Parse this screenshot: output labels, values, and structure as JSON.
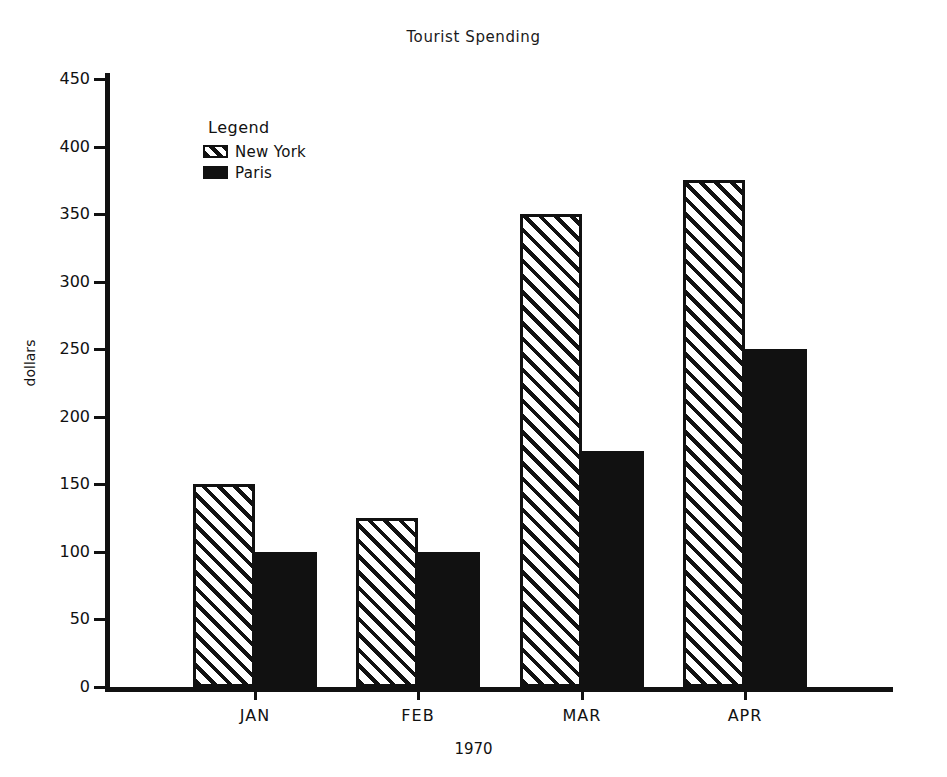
{
  "chart_data": {
    "type": "bar",
    "title": "Tourist Spending",
    "xlabel": "1970",
    "ylabel": "dollars",
    "categories": [
      "JAN",
      "FEB",
      "MAR",
      "APR"
    ],
    "series": [
      {
        "name": "New York",
        "values": [
          150,
          125,
          350,
          375
        ],
        "fill": "hatched",
        "color": "#111111"
      },
      {
        "name": "Paris",
        "values": [
          100,
          100,
          175,
          250
        ],
        "fill": "solid",
        "color": "#111111"
      }
    ],
    "ylim": [
      0,
      450
    ],
    "ytick_labels": [
      "450",
      "400",
      "350",
      "300",
      "250",
      "200",
      "150",
      "100",
      "50",
      "0"
    ],
    "ytick_values": [
      450,
      400,
      350,
      300,
      250,
      200,
      150,
      100,
      50,
      0
    ],
    "grid": false,
    "legend": {
      "title": "Legend",
      "position": "inside-top-left",
      "entries": [
        {
          "label": "New York",
          "fill": "hatched"
        },
        {
          "label": "Paris",
          "fill": "solid"
        }
      ]
    }
  }
}
